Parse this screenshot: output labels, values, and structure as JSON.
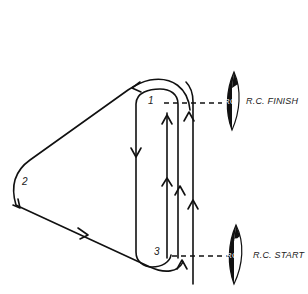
{
  "diagram": {
    "type": "sailing-race-course",
    "marks": [
      {
        "id": "1",
        "label": "1"
      },
      {
        "id": "2",
        "label": "2"
      },
      {
        "id": "3",
        "label": "3"
      }
    ],
    "committee_boats": [
      {
        "role": "finish",
        "label": "R.C. FINISH",
        "hull_text": "RC"
      },
      {
        "role": "start",
        "label": "R.C. START",
        "hull_text": "RC"
      }
    ],
    "colors": {
      "line": "#111111",
      "background": "#ffffff"
    }
  }
}
